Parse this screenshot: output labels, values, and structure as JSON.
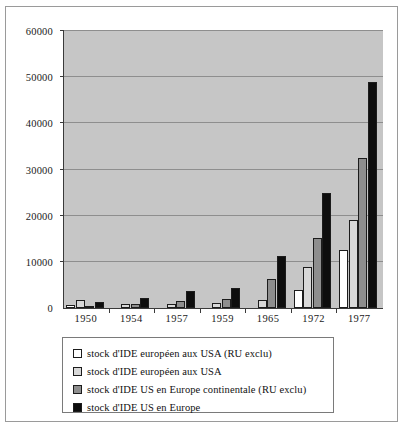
{
  "chart_data": {
    "type": "bar",
    "title": "",
    "xlabel": "",
    "ylabel": "",
    "ylim": [
      0,
      60000
    ],
    "ytick_step": 10000,
    "ytick_labels": [
      "0",
      "10000",
      "20000",
      "30000",
      "40000",
      "50000",
      "60000"
    ],
    "grid": true,
    "legend_position": "below",
    "categories": [
      "1950",
      "1954",
      "1957",
      "1959",
      "1965",
      "1972",
      "1977"
    ],
    "series": [
      {
        "name": "stock d'IDE européen aux USA (RU exclu)",
        "color": "#ffffff",
        "values": [
          700,
          0,
          0,
          0,
          0,
          3800,
          12500
        ]
      },
      {
        "name": "stock d'IDE européen aux USA",
        "color": "#d8d8d8",
        "values": [
          1800,
          800,
          900,
          1000,
          1700,
          8900,
          19000
        ]
      },
      {
        "name": "stock d'IDE US en Europe continentale (RU exclu)",
        "color": "#8e8e8e",
        "values": [
          500,
          900,
          1600,
          2000,
          6200,
          15200,
          32500
        ]
      },
      {
        "name": "stock d'IDE US en Europe",
        "color": "#0d0d0d",
        "values": [
          1400,
          2200,
          3600,
          4400,
          11200,
          24900,
          49000
        ]
      }
    ]
  },
  "plot": {
    "background_color": "#c6c6c6",
    "gridline_color": "#8e8e8e",
    "axis_color": "#3a3a3a"
  },
  "legend": {
    "items": [
      {
        "label": "stock d'IDE européen aux USA (RU exclu)",
        "swatch": "#ffffff"
      },
      {
        "label": "stock d'IDE européen aux USA",
        "swatch": "#d8d8d8"
      },
      {
        "label": "stock d'IDE US en Europe continentale (RU exclu)",
        "swatch": "#8e8e8e"
      },
      {
        "label": "stock d'IDE US en Europe",
        "swatch": "#0d0d0d"
      }
    ]
  }
}
